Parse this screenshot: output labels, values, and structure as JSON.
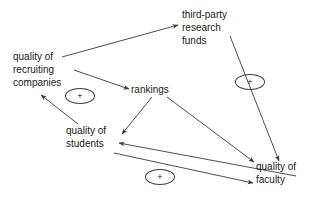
{
  "diagram": {
    "type": "causal-loop-diagram",
    "background_color": "#ffffff",
    "line_color": "#3a3a3a",
    "text_color": "#1a1a1a",
    "nodes": [
      {
        "id": "quality-of-recruiting-companies",
        "label": "quality of\nrecruiting\ncompanies",
        "x": 13,
        "y": 50,
        "align": "left"
      },
      {
        "id": "third-party-research-funds",
        "label": "third-party\nresearch\nfunds",
        "x": 182,
        "y": 8,
        "align": "left"
      },
      {
        "id": "rankings",
        "label": "rankings",
        "x": 131,
        "y": 83,
        "align": "left"
      },
      {
        "id": "quality-of-students",
        "label": "quality of\nstudents",
        "x": 66,
        "y": 124,
        "align": "left"
      },
      {
        "id": "quality-of-faculty",
        "label": "quality of\nfaculty",
        "x": 256,
        "y": 160,
        "align": "left"
      }
    ],
    "edges": [
      {
        "id": "recruiting-companies-to-research-funds",
        "from": "quality-of-recruiting-companies",
        "to": "third-party-research-funds",
        "polarity": ""
      },
      {
        "id": "recruiting-companies-to-rankings",
        "from": "quality-of-recruiting-companies",
        "to": "rankings",
        "polarity": ""
      },
      {
        "id": "research-funds-to-quality-of-faculty",
        "from": "third-party-research-funds",
        "to": "quality-of-faculty",
        "polarity": "+"
      },
      {
        "id": "rankings-to-quality-of-students",
        "from": "rankings",
        "to": "quality-of-students",
        "polarity": ""
      },
      {
        "id": "rankings-to-quality-of-faculty",
        "from": "rankings",
        "to": "quality-of-faculty",
        "polarity": ""
      },
      {
        "id": "quality-of-students-to-recruiting-companies",
        "from": "quality-of-students",
        "to": "quality-of-recruiting-companies",
        "polarity": "+"
      },
      {
        "id": "quality-of-faculty-to-quality-of-students",
        "from": "quality-of-faculty",
        "to": "quality-of-students",
        "polarity": ""
      },
      {
        "id": "quality-of-students-to-quality-of-faculty",
        "from": "quality-of-students",
        "to": "quality-of-faculty",
        "polarity": "+"
      }
    ],
    "polarity_markers": [
      {
        "id": "polarity-recruiting-students",
        "symbol": "+",
        "x": 65,
        "y": 88
      },
      {
        "id": "polarity-research-funds-faculty",
        "symbol": "+",
        "x": 235,
        "y": 74
      },
      {
        "id": "polarity-students-faculty",
        "symbol": "+",
        "x": 145,
        "y": 169
      }
    ]
  }
}
